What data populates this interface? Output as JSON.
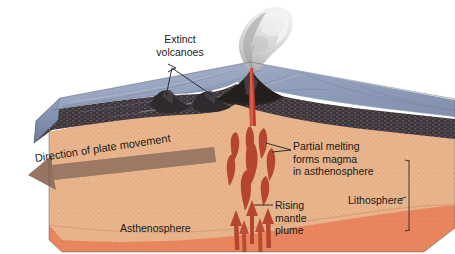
{
  "figure": {
    "type": "geological-cross-section-diagram",
    "width": 455,
    "height": 254
  },
  "labels": {
    "extinct_volcanoes": "Extinct\nvolcanoes",
    "partial_melting": "Partial melting\nforms magma\nin asthenosphere",
    "rising_mantle_plume": "Rising\nmantle\nplume",
    "lithosphere": "Lithosphere",
    "asthenosphere": "Asthenosphere",
    "plate_movement": "Direction of plate movement"
  },
  "layers": [
    {
      "name": "ocean-water",
      "label": "",
      "color": "#8d9cb8"
    },
    {
      "name": "oceanic-crust",
      "label": "",
      "color": "#3a3338"
    },
    {
      "name": "lithosphere",
      "label": "Lithosphere",
      "color": "#e6b289"
    },
    {
      "name": "asthenosphere",
      "label": "Asthenosphere",
      "color": "#e8855c"
    }
  ],
  "features": [
    {
      "name": "active-volcano",
      "label": "",
      "color": "#2b2420"
    },
    {
      "name": "volcanic-plume",
      "label": "",
      "color": "#d9d9d9"
    },
    {
      "name": "magma-conduit",
      "label": "",
      "color": "#c0392b"
    },
    {
      "name": "magma-blobs",
      "label": "",
      "color": "#b5452e"
    },
    {
      "name": "plume-arrows",
      "label": "",
      "color": "#b5452e"
    },
    {
      "name": "extinct-seamount-left",
      "label": "",
      "color": "#3a3338"
    },
    {
      "name": "extinct-seamount-right",
      "label": "",
      "color": "#3a3338"
    }
  ],
  "colors": {
    "background": "#ffffff",
    "water": "#8d9cb8",
    "water_light": "#9fadc6",
    "crust": "#3a3338",
    "lithosphere": "#e6b289",
    "asthenosphere": "#e8855c",
    "magma": "#b5452e",
    "conduit": "#c0392b",
    "plume_smoke": "#d8d8d8",
    "text": "#1a1a1a",
    "arrow_fill": "#8d6a56",
    "leader_line": "#2b2b2b"
  },
  "annotations": {
    "leader_extinct_volcanoes": "two leader lines from label to two extinct seamount peaks",
    "leader_partial_melting": "leader line from label left to magma blob",
    "leader_rising_plume": "leader line from label left to rising arrows",
    "bracket_lithosphere": "vertical bracket on right face spanning lithosphere thickness",
    "arrow_plate_movement": "large flat arrow pointing left across lithosphere top"
  }
}
